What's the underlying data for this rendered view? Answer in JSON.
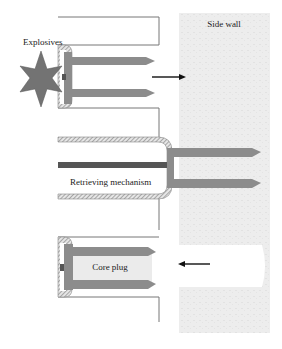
{
  "diagram": {
    "labels": {
      "explosives": "Explosives",
      "side_wall": "Side wall",
      "retrieving_mechanism": "Retrieving mechanism",
      "core_plug": "Core plug"
    },
    "stages": [
      {
        "name": "firing",
        "description": "Explosives fire bullet-shaped prongs into side wall",
        "arrow_direction": "right"
      },
      {
        "name": "retrieval",
        "description": "Retrieving mechanism with prongs embedded in side wall"
      },
      {
        "name": "core-recovery",
        "description": "Core plug pulled back from side wall",
        "arrow_direction": "left"
      }
    ],
    "colors": {
      "prong": "#8c8c8c",
      "rod": "#555555",
      "wall": "#ececec",
      "hatch": "#9a9a9a",
      "star": "#707070",
      "outline": "#666666"
    }
  }
}
